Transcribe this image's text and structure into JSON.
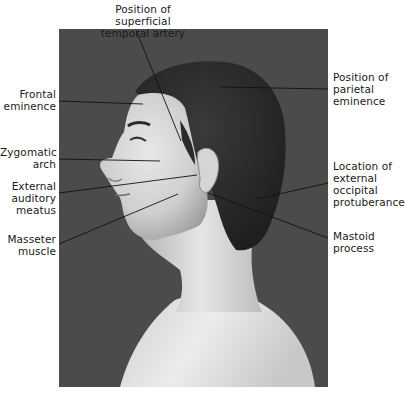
{
  "figure": {
    "photo": {
      "background_color": "#4b4b4b",
      "subject": "Lateral profile of male head and neck facing left",
      "x": 59,
      "y": 29,
      "width": 269,
      "height": 358
    },
    "labels": [
      {
        "id": "superficial-temporal-artery",
        "lines": [
          "Position of superficial",
          "temporal artery"
        ]
      },
      {
        "id": "frontal-eminence",
        "lines": [
          "Frontal",
          "eminence"
        ]
      },
      {
        "id": "zygomatic-arch",
        "lines": [
          "Zygomatic",
          "arch"
        ]
      },
      {
        "id": "external-auditory-meatus",
        "lines": [
          "External",
          "auditory",
          "meatus"
        ]
      },
      {
        "id": "masseter-muscle",
        "lines": [
          "Masseter",
          "muscle"
        ]
      },
      {
        "id": "parietal-eminence",
        "lines": [
          "Position of",
          "parietal",
          "eminence"
        ]
      },
      {
        "id": "external-occipital-protuberance",
        "lines": [
          "Location of",
          "external",
          "occipital",
          "protuberance"
        ]
      },
      {
        "id": "mastoid-process",
        "lines": [
          "Mastoid",
          "process"
        ]
      }
    ]
  }
}
